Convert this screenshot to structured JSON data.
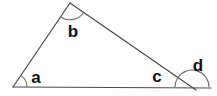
{
  "diagram": {
    "kind": "geometry-triangle-with-exterior-angle",
    "canvas": {
      "width": 217,
      "height": 96
    },
    "background_color": "#fdfdfd",
    "stroke_color": "#4a4a4a",
    "label_color": "#111111",
    "stroke_width": 1.2,
    "vertices": [
      {
        "name": "left-vertex",
        "id": "A",
        "x": 13,
        "y": 87
      },
      {
        "name": "apex-vertex",
        "id": "B",
        "x": 70,
        "y": 3
      },
      {
        "name": "right-vertex",
        "id": "C",
        "x": 192,
        "y": 87
      }
    ],
    "segments": [
      {
        "name": "baseline",
        "x1": 13,
        "y1": 87,
        "x2": 211,
        "y2": 88
      },
      {
        "name": "left-side",
        "x1": 13,
        "y1": 87,
        "x2": 70,
        "y2": 3
      },
      {
        "name": "hypotenuse",
        "x1": 70,
        "y1": 3,
        "x2": 196,
        "y2": 90
      }
    ],
    "arcs": [
      {
        "name": "angle-arc-a",
        "vertex": "A",
        "radius": 14,
        "start_deg": 0,
        "end_deg": 56,
        "sweep": "minor"
      },
      {
        "name": "angle-arc-b",
        "vertex": "B",
        "radius": 17,
        "start_deg": 236,
        "end_deg": 325,
        "sweep": "minor"
      },
      {
        "name": "angle-arc-c",
        "vertex": "C",
        "radius": 17,
        "start_deg": 145,
        "end_deg": 180,
        "sweep": "minor"
      },
      {
        "name": "angle-arc-d",
        "vertex": "C",
        "radius": 17,
        "start_deg": 0,
        "end_deg": 145,
        "sweep": "major"
      }
    ],
    "labels": [
      {
        "name": "angle-label-a",
        "text": "a",
        "x": 36,
        "y": 83
      },
      {
        "name": "angle-label-b",
        "text": "b",
        "x": 73,
        "y": 37
      },
      {
        "name": "angle-label-c",
        "text": "c",
        "x": 157,
        "y": 82
      },
      {
        "name": "angle-label-d",
        "text": "d",
        "x": 198,
        "y": 71
      }
    ]
  }
}
